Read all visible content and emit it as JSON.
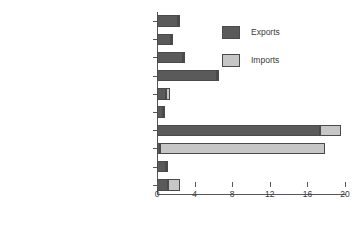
{
  "chart_data": {
    "type": "bar",
    "orientation": "horizontal",
    "stacked": true,
    "title": "",
    "xlabel": "",
    "ylabel": "",
    "xlim": [
      0,
      20
    ],
    "xticks": [
      0,
      4,
      8,
      12,
      16,
      20
    ],
    "grid": false,
    "legend_position": "upper-right",
    "categories": [
      "Other manufactures",
      "Clothing",
      "Textiles",
      "Machinery and transport equipment",
      "Chemicals",
      "Iron and steel",
      "Manufactures",
      "Fuels and mining products",
      "Food",
      "Agricultural products"
    ],
    "series": [
      {
        "name": "Exports",
        "color": "#5a5a5a",
        "values": [
          2.3,
          1.6,
          2.9,
          6.5,
          1.0,
          0.6,
          17.3,
          0.3,
          1.0,
          1.2
        ]
      },
      {
        "name": "Imports",
        "color": "#c6c6c6",
        "values": [
          0.1,
          0.05,
          0.1,
          0.1,
          0.4,
          0.3,
          2.3,
          17.6,
          0.2,
          1.3
        ]
      }
    ]
  },
  "legend": {
    "items": [
      {
        "label": "Exports",
        "swatch": "exports"
      },
      {
        "label": "Imports",
        "swatch": "imports"
      }
    ]
  }
}
